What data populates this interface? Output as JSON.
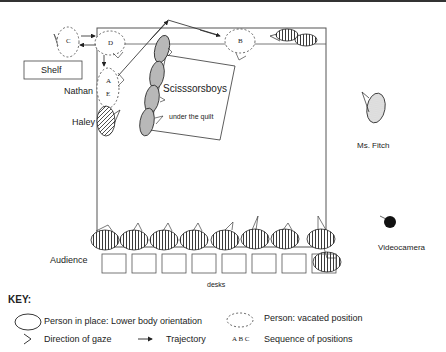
{
  "diagram": {
    "labels": {
      "shelf": "Shelf",
      "nathan": "Nathan",
      "haley": "Haley",
      "scissorsboys": "Scisssorsboys",
      "under_quilt": "under the quilt",
      "ms_fitch": "Ms. Fitch",
      "videocamera": "Videocamera",
      "audience": "Audience",
      "desks": "desks"
    },
    "positions": {
      "A": "A",
      "B": "B",
      "C": "C",
      "D": "D",
      "E": "E"
    },
    "audience_count": 9,
    "desk_count": 8
  },
  "key": {
    "heading": "KEY:",
    "person_in_place": "Person in place: Lower body orientation",
    "vacated": "Person:  vacated position",
    "gaze": "Direction of gaze",
    "trajectory": "Trajectory",
    "sequence_letters": "A  B  C",
    "sequence": "Sequence of positions"
  }
}
